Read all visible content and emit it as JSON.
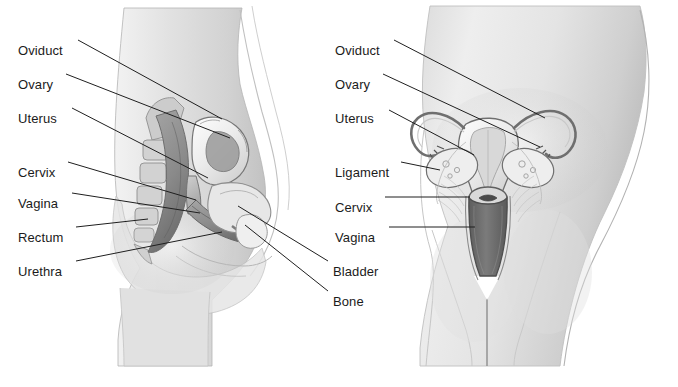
{
  "figure": {
    "background_color": "#ffffff",
    "label_text_color": "#1b1b1b",
    "leader_line_color": "#1f1f1f",
    "ink_color": "#8d8d8d",
    "panels": [
      {
        "id": "sagittal",
        "name": "lateral-sagittal-view",
        "labels": [
          {
            "key": "oviduct",
            "text": "Oviduct",
            "x": 18,
            "y": 44,
            "leader": {
              "x1": 78,
              "y1": 40,
              "x2": 222,
              "y2": 119
            }
          },
          {
            "key": "ovary",
            "text": "Ovary",
            "x": 18,
            "y": 78,
            "leader": {
              "x1": 66,
              "y1": 74,
              "x2": 230,
              "y2": 138
            }
          },
          {
            "key": "uterus",
            "text": "Uterus",
            "x": 18,
            "y": 112,
            "leader": {
              "x1": 72,
              "y1": 108,
              "x2": 208,
              "y2": 178
            }
          },
          {
            "key": "cervix",
            "text": "Cervix",
            "x": 18,
            "y": 166,
            "leader": {
              "x1": 68,
              "y1": 162,
              "x2": 196,
              "y2": 200
            }
          },
          {
            "key": "vagina",
            "text": "Vagina",
            "x": 18,
            "y": 197,
            "leader": {
              "x1": 72,
              "y1": 193,
              "x2": 200,
              "y2": 213
            }
          },
          {
            "key": "rectum",
            "text": "Rectum",
            "x": 18,
            "y": 231,
            "leader": {
              "x1": 76,
              "y1": 227,
              "x2": 148,
              "y2": 219
            }
          },
          {
            "key": "urethra",
            "text": "Urethra",
            "x": 18,
            "y": 265,
            "leader": {
              "x1": 76,
              "y1": 261,
              "x2": 222,
              "y2": 232
            }
          },
          {
            "key": "bladder",
            "text": "Bladder",
            "x": 333,
            "y": 265,
            "leader": {
              "x1": 328,
              "y1": 261,
              "x2": 238,
              "y2": 206
            }
          },
          {
            "key": "bone",
            "text": "Bone",
            "x": 333,
            "y": 295,
            "leader": {
              "x1": 328,
              "y1": 291,
              "x2": 245,
              "y2": 225
            }
          }
        ]
      },
      {
        "id": "frontal",
        "name": "anterior-frontal-view",
        "labels": [
          {
            "key": "oviduct",
            "text": "Oviduct",
            "x": 335,
            "y": 44,
            "leader": {
              "x1": 394,
              "y1": 40,
              "x2": 545,
              "y2": 118
            }
          },
          {
            "key": "ovary",
            "text": "Ovary",
            "x": 335,
            "y": 78,
            "leader": {
              "x1": 383,
              "y1": 74,
              "x2": 540,
              "y2": 147
            }
          },
          {
            "key": "uterus",
            "text": "Uterus",
            "x": 335,
            "y": 112,
            "leader": {
              "x1": 389,
              "y1": 110,
              "x2": 474,
              "y2": 155
            }
          },
          {
            "key": "ligament",
            "text": "Ligament",
            "x": 335,
            "y": 166,
            "leader": {
              "x1": 401,
              "y1": 162,
              "x2": 440,
              "y2": 170
            }
          },
          {
            "key": "cervix",
            "text": "Cervix",
            "x": 335,
            "y": 201,
            "leader": {
              "x1": 385,
              "y1": 197,
              "x2": 470,
              "y2": 197
            }
          },
          {
            "key": "vagina",
            "text": "Vagina",
            "x": 335,
            "y": 231,
            "leader": {
              "x1": 389,
              "y1": 227,
              "x2": 475,
              "y2": 227
            }
          }
        ]
      }
    ]
  }
}
